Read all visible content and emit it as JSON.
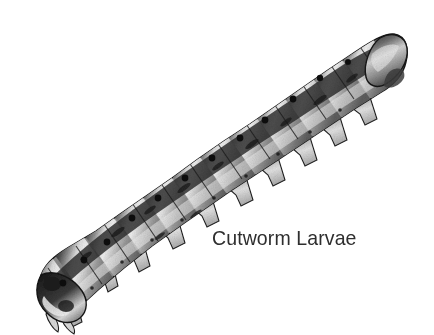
{
  "figure": {
    "caption": "Cutworm Larvae",
    "style": "black-and-white halftone line illustration",
    "background_color": "#ffffff",
    "caption_color": "#2e2e2e",
    "body_colors": {
      "outline": "#1a1a1a",
      "dark_dorsal": "#3a3a3a",
      "mid_gray": "#8d8d8d",
      "highlight": "#e8e8e8",
      "shadow": "#4a4a4a",
      "spiracle_dot": "#111111"
    },
    "orientation": "diagonal, head at lower-left, tail at upper-right",
    "segment_count": 12,
    "spiracles": [
      {
        "x": 63,
        "y": 283
      },
      {
        "x": 84,
        "y": 260
      },
      {
        "x": 107,
        "y": 242
      },
      {
        "x": 132,
        "y": 218
      },
      {
        "x": 158,
        "y": 198
      },
      {
        "x": 185,
        "y": 178
      },
      {
        "x": 212,
        "y": 158
      },
      {
        "x": 240,
        "y": 138
      },
      {
        "x": 265,
        "y": 120
      },
      {
        "x": 293,
        "y": 99
      },
      {
        "x": 320,
        "y": 78
      },
      {
        "x": 348,
        "y": 62
      }
    ]
  }
}
